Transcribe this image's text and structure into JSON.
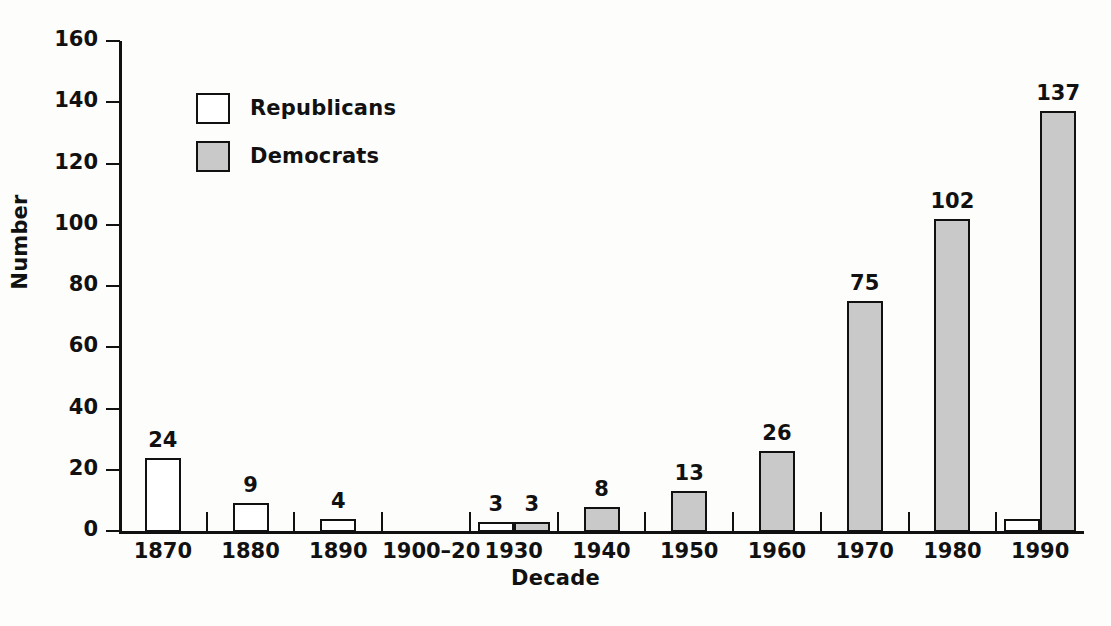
{
  "chart_data": {
    "type": "bar",
    "title": "",
    "xlabel": "Decade",
    "ylabel": "Number",
    "ylim": [
      0,
      160
    ],
    "ytick_values": [
      0,
      20,
      40,
      60,
      80,
      100,
      120,
      140,
      160
    ],
    "ytick_labels": [
      "0",
      "20",
      "40",
      "60",
      "80",
      "100",
      "120",
      "140",
      "160"
    ],
    "grid": false,
    "legend_position": "upper-left-inside",
    "categories": [
      "1870",
      "1880",
      "1890",
      "1900–20",
      "1930",
      "1940",
      "1950",
      "1960",
      "1970",
      "1980",
      "1990"
    ],
    "series": [
      {
        "name": "Republicans",
        "color": "#ffffff",
        "values": [
          24,
          9,
          4,
          null,
          3,
          null,
          null,
          null,
          null,
          null,
          4
        ],
        "labels": [
          "24",
          "9",
          "4",
          "",
          "3",
          "",
          "",
          "",
          "",
          "",
          ""
        ]
      },
      {
        "name": "Democrats",
        "color": "#c9c9c9",
        "values": [
          null,
          null,
          null,
          null,
          3,
          8,
          13,
          26,
          75,
          102,
          137
        ],
        "labels": [
          "",
          "",
          "",
          "",
          "3",
          "8",
          "13",
          "26",
          "75",
          "102",
          "137"
        ]
      }
    ]
  },
  "legend": {
    "items": [
      {
        "label": "Republicans",
        "swatch": "rep"
      },
      {
        "label": "Democrats",
        "swatch": "dem"
      }
    ]
  },
  "axes": {
    "y_title": "Number",
    "x_title": "Decade"
  }
}
